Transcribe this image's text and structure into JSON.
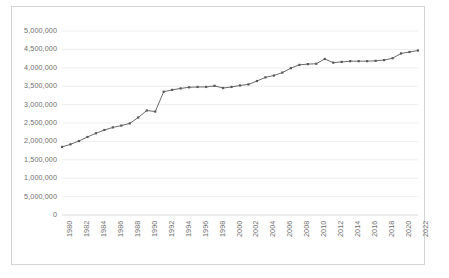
{
  "chart_data": {
    "type": "line",
    "title": "",
    "subtitle": "",
    "xlabel": "",
    "ylabel": "",
    "grid": true,
    "legend": false,
    "legend_position": "none",
    "series_color": "#595959",
    "marker": "square",
    "xlim": [
      1980,
      2022
    ],
    "ylim": [
      0,
      5000000
    ],
    "ytick_labels": [
      "5,000,000",
      "4,500,000",
      "4,000,000",
      "3,500,000",
      "3,000,000",
      "2,500,000",
      "2,000,000",
      "1,500,000",
      "1,000,000",
      "5,000,000",
      "0"
    ],
    "ytick_values": [
      5000000,
      4500000,
      4000000,
      3500000,
      3000000,
      2500000,
      2000000,
      1500000,
      1000000,
      500000,
      0
    ],
    "xtick_labels": [
      "1980",
      "1982",
      "1984",
      "1986",
      "1988",
      "1990",
      "1992",
      "1994",
      "1996",
      "1998",
      "2000",
      "2002",
      "2004",
      "2006",
      "2008",
      "2010",
      "2012",
      "2014",
      "2016",
      "2018",
      "2020",
      "2022"
    ],
    "x": [
      1980,
      1981,
      1982,
      1983,
      1984,
      1985,
      1986,
      1987,
      1988,
      1989,
      1990,
      1991,
      1992,
      1993,
      1994,
      1995,
      1996,
      1997,
      1998,
      1999,
      2000,
      2001,
      2002,
      2003,
      2004,
      2005,
      2006,
      2007,
      2008,
      2009,
      2010,
      2011,
      2012,
      2013,
      2014,
      2015,
      2016,
      2017,
      2018,
      2019,
      2020,
      2021,
      2022
    ],
    "values": [
      1850000,
      1920000,
      2010000,
      2120000,
      2220000,
      2310000,
      2380000,
      2430000,
      2490000,
      2650000,
      2840000,
      2810000,
      3350000,
      3400000,
      3440000,
      3470000,
      3480000,
      3480000,
      3510000,
      3450000,
      3480000,
      3520000,
      3550000,
      3640000,
      3740000,
      3790000,
      3870000,
      3990000,
      4080000,
      4100000,
      4110000,
      4240000,
      4140000,
      4160000,
      4180000,
      4180000,
      4180000,
      4190000,
      4210000,
      4260000,
      4390000,
      4430000,
      4470000
    ]
  },
  "plot": {
    "left": 62,
    "right": 418,
    "top": 31,
    "bottom": 215
  }
}
